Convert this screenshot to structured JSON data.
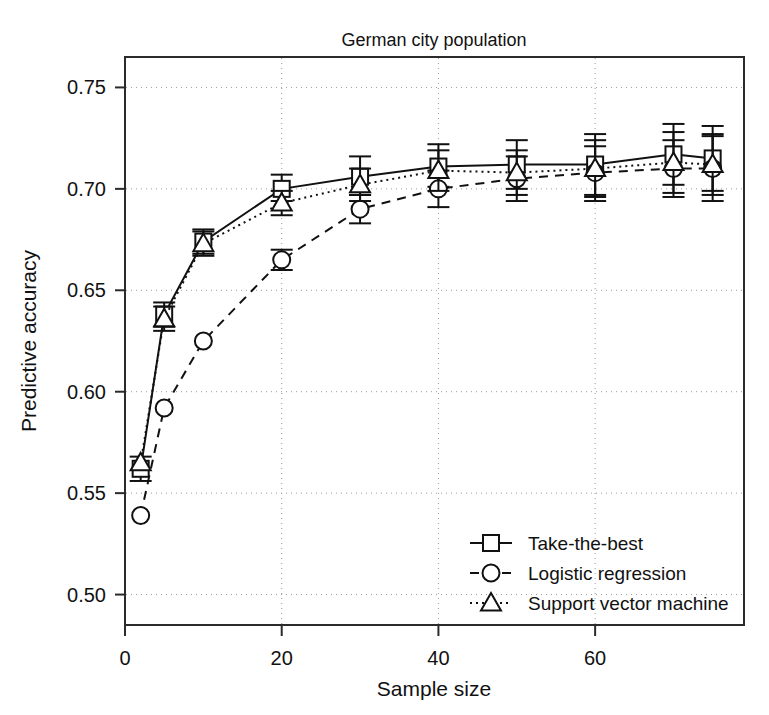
{
  "chart_data": {
    "type": "line",
    "title": "German city population",
    "xlabel": "Sample size",
    "ylabel": "Predictive accuracy",
    "xlim": [
      0,
      79
    ],
    "ylim": [
      0.485,
      0.765
    ],
    "xticks": [
      0,
      20,
      40,
      60
    ],
    "xtick_labels": [
      "0",
      "20",
      "40",
      "60"
    ],
    "yticks": [
      0.5,
      0.55,
      0.6,
      0.65,
      0.7,
      0.75
    ],
    "ytick_labels": [
      "0.50",
      "0.55",
      "0.60",
      "0.65",
      "0.70",
      "0.75"
    ],
    "grid": true,
    "grid_style": "dotted",
    "legend_position": "bottom-right",
    "x": [
      2,
      5,
      10,
      20,
      30,
      40,
      50,
      60,
      70,
      75
    ],
    "series": [
      {
        "name": "Take-the-best",
        "marker": "square",
        "line_style": "solid",
        "values": [
          0.562,
          0.638,
          0.674,
          0.7,
          0.706,
          0.711,
          0.712,
          0.712,
          0.717,
          0.715
        ],
        "err_low": [
          0.556,
          0.632,
          0.668,
          0.694,
          0.697,
          0.701,
          0.7,
          0.697,
          0.702,
          0.699
        ],
        "err_high": [
          0.568,
          0.644,
          0.68,
          0.707,
          0.716,
          0.722,
          0.724,
          0.727,
          0.732,
          0.731
        ]
      },
      {
        "name": "Logistic regression",
        "marker": "circle",
        "line_style": "dashed",
        "values": [
          0.539,
          0.592,
          0.625,
          0.665,
          0.69,
          0.7,
          0.705,
          0.708,
          0.71,
          0.71
        ],
        "err_low": [
          0.539,
          0.592,
          0.625,
          0.66,
          0.683,
          0.691,
          0.694,
          0.694,
          0.696,
          0.694
        ],
        "err_high": [
          0.539,
          0.592,
          0.625,
          0.67,
          0.697,
          0.709,
          0.716,
          0.721,
          0.724,
          0.726
        ]
      },
      {
        "name": "Support vector machine",
        "marker": "triangle",
        "line_style": "dotted",
        "values": [
          0.565,
          0.636,
          0.673,
          0.693,
          0.702,
          0.709,
          0.708,
          0.71,
          0.713,
          0.712
        ],
        "err_low": [
          0.565,
          0.63,
          0.667,
          0.687,
          0.694,
          0.699,
          0.697,
          0.696,
          0.698,
          0.697
        ],
        "err_high": [
          0.565,
          0.642,
          0.679,
          0.699,
          0.71,
          0.719,
          0.719,
          0.724,
          0.728,
          0.727
        ]
      }
    ]
  },
  "legend": {
    "entries": [
      {
        "label": "Take-the-best"
      },
      {
        "label": "Logistic regression"
      },
      {
        "label": "Support vector machine"
      }
    ]
  }
}
